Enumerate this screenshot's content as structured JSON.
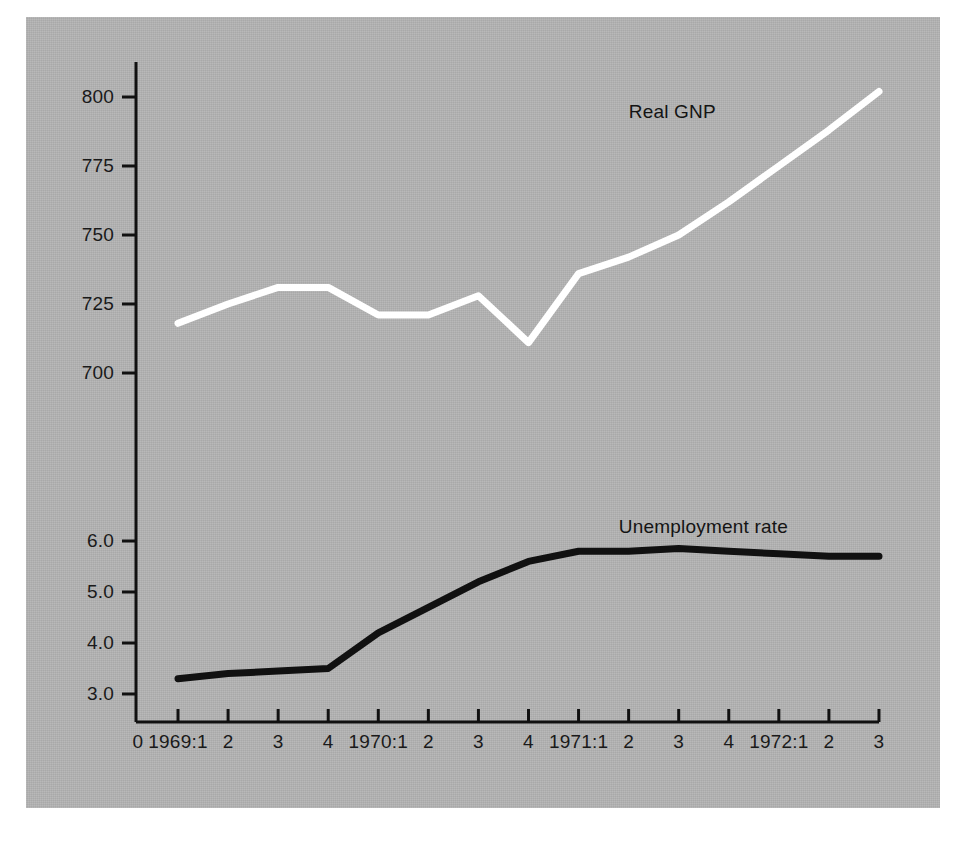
{
  "figure": {
    "background_color": "#ffffff",
    "panel_color": "#b4b4b4",
    "axis_color": "#111111"
  },
  "chart_data": {
    "type": "line",
    "title": "",
    "subtitle": "",
    "xlabel": "",
    "ylabel": "",
    "grid": false,
    "legend_position": "inline-annotations",
    "x": [
      "1969:1",
      "1969:2",
      "1969:3",
      "1969:4",
      "1970:1",
      "1970:2",
      "1970:3",
      "1970:4",
      "1971:1",
      "1971:2",
      "1971:3",
      "1971:4",
      "1972:1",
      "1972:2",
      "1972:3"
    ],
    "x_tick_labels": [
      "1969:1",
      "2",
      "3",
      "4",
      "1970:1",
      "2",
      "3",
      "4",
      "1971:1",
      "2",
      "3",
      "4",
      "1972:1",
      "2",
      "3"
    ],
    "x_origin_label": "0",
    "axes": [
      {
        "name": "real-gnp-axis",
        "tick_labels": [
          "800",
          "775",
          "750",
          "725",
          "700"
        ],
        "tick_values": [
          800,
          775,
          750,
          725,
          700
        ],
        "range": [
          700,
          800
        ]
      },
      {
        "name": "unemployment-axis",
        "tick_labels": [
          "6.0",
          "5.0",
          "4.0",
          "3.0"
        ],
        "tick_values": [
          6.0,
          5.0,
          4.0,
          3.0
        ],
        "range": [
          3.0,
          6.0
        ]
      }
    ],
    "series": [
      {
        "name": "Real GNP",
        "label": "Real GNP",
        "color": "#ffffff",
        "axis": "real-gnp-axis",
        "values": [
          718,
          725,
          731,
          731,
          721,
          721,
          728,
          711,
          736,
          742,
          750,
          762,
          775,
          788,
          802
        ]
      },
      {
        "name": "Unemployment rate",
        "label": "Unemployment rate",
        "color": "#111111",
        "axis": "unemployment-axis",
        "values": [
          3.3,
          3.4,
          3.45,
          3.5,
          4.2,
          4.7,
          5.2,
          5.6,
          5.8,
          5.8,
          5.85,
          5.8,
          5.75,
          5.7,
          5.7
        ]
      }
    ],
    "annotations": [
      {
        "text": "Real GNP",
        "x_index": 11,
        "value": 795
      },
      {
        "text": "Unemployment rate",
        "x_index": 11,
        "value": 6.3
      }
    ]
  }
}
